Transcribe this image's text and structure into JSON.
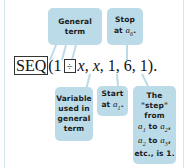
{
  "formula": {
    "key": "SEQ",
    "open": "(1",
    "operator_key": "÷",
    "var1": "x",
    "rest_sep": ", ",
    "var2": "x",
    "args": ", 1, 6, 1)."
  },
  "callouts": {
    "general_term": {
      "line1": "General",
      "line2": "term"
    },
    "stop": {
      "line1": "Stop",
      "line2": "at",
      "sub": "6"
    },
    "variable": {
      "line1": "Variable",
      "line2": "used in",
      "line3": "general",
      "line4": "term"
    },
    "start": {
      "line1": "Start",
      "line2": "at",
      "sub": "1"
    },
    "step": {
      "line1": "The",
      "line2": "\"step\"",
      "line3": "from",
      "line4": "to",
      "line5": "to",
      "line6": "etc., is 1."
    }
  },
  "colors": {
    "callout_bg": "#bcdbe8",
    "leader": "#bcdbe8"
  }
}
